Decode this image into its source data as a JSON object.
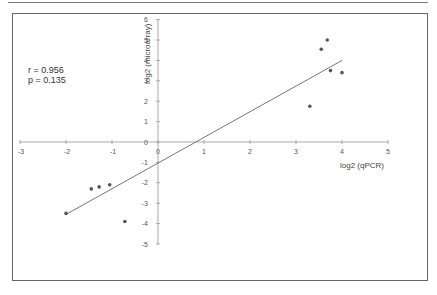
{
  "chart_data": {
    "type": "scatter",
    "title": "",
    "xlabel": "log2 (qPCR)",
    "ylabel": "log2 (microarray)",
    "xlim": [
      -3,
      5
    ],
    "ylim": [
      -5,
      6
    ],
    "x_ticks": [
      "-3",
      "-2",
      "-1",
      "0",
      "1",
      "2",
      "3",
      "4",
      "5"
    ],
    "y_ticks": [
      "6",
      "5",
      "4",
      "3",
      "2",
      "1",
      "0",
      "-1",
      "-2",
      "-3",
      "-4",
      "-5"
    ],
    "grid": false,
    "legend": null,
    "series": [
      {
        "name": "genes",
        "points": [
          {
            "x": 3.68,
            "y": 5.0
          },
          {
            "x": 3.55,
            "y": 4.55
          },
          {
            "x": 3.75,
            "y": 3.5
          },
          {
            "x": 4.0,
            "y": 3.4
          },
          {
            "x": 3.3,
            "y": 1.75
          },
          {
            "x": -2.0,
            "y": -3.5
          },
          {
            "x": -1.45,
            "y": -2.3
          },
          {
            "x": -1.28,
            "y": -2.2
          },
          {
            "x": -1.05,
            "y": -2.1
          },
          {
            "x": -0.72,
            "y": -3.9
          }
        ]
      }
    ],
    "trendline": {
      "x1": -2.0,
      "y1": -3.55,
      "x2": 4.0,
      "y2": 4.0
    },
    "annotations": [
      "r = 0.956",
      "p = 0.135"
    ]
  },
  "stats": {
    "r_text": "r = 0.956",
    "p_text": "p = 0.135"
  },
  "axes": {
    "xlabel": "log2 (qPCR)",
    "ylabel": "log2 (microarray)"
  }
}
